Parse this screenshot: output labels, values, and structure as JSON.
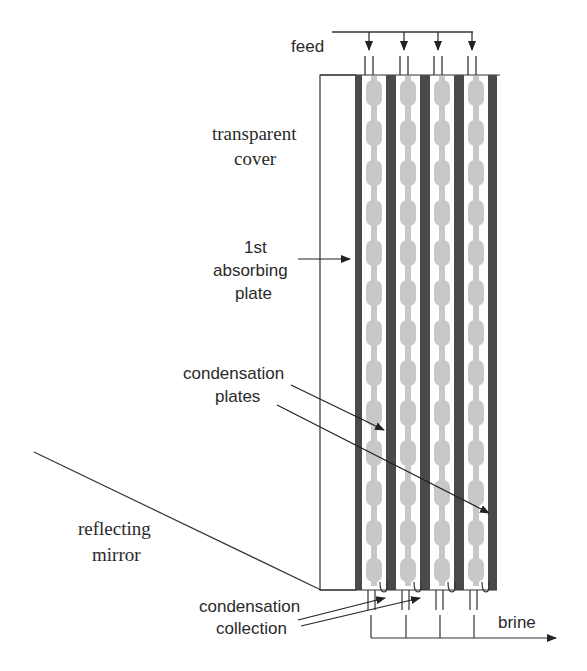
{
  "diagram": {
    "labels": {
      "feed": "feed",
      "transparent_cover_1": "transparent",
      "transparent_cover_2": "cover",
      "absorbing_1": "1st",
      "absorbing_2": "absorbing",
      "absorbing_3": "plate",
      "condensation_plates_1": "condensation",
      "condensation_plates_2": "plates",
      "reflecting_mirror_1": "reflecting",
      "reflecting_mirror_2": "mirror",
      "condensation_collection_1": "condensation",
      "condensation_collection_2": "collection",
      "brine": "brine"
    },
    "stages": 4,
    "colors": {
      "plate": "#4a4a4a",
      "water_film": "#c8c8c8",
      "line": "#333333",
      "background": "#ffffff"
    }
  }
}
